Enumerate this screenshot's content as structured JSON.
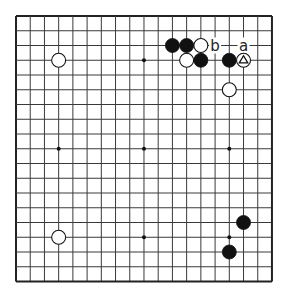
{
  "board": {
    "size": 19,
    "origin_x": 16,
    "origin_y": 16,
    "spacing_x": 14.22,
    "spacing_y": 14.75,
    "stone_radius": 7,
    "line_color": "#3a3a3a",
    "border_color": "#222222",
    "star_points": [
      [
        3,
        3
      ],
      [
        3,
        9
      ],
      [
        3,
        15
      ],
      [
        9,
        3
      ],
      [
        9,
        9
      ],
      [
        9,
        15
      ],
      [
        15,
        3
      ],
      [
        15,
        9
      ],
      [
        15,
        15
      ]
    ]
  },
  "stones": [
    {
      "color": "white",
      "col": 3,
      "row": 3
    },
    {
      "color": "black",
      "col": 11,
      "row": 2
    },
    {
      "color": "black",
      "col": 12,
      "row": 2
    },
    {
      "color": "white",
      "col": 13,
      "row": 2
    },
    {
      "color": "white",
      "col": 12,
      "row": 3
    },
    {
      "color": "black",
      "col": 13,
      "row": 3
    },
    {
      "color": "black",
      "col": 15,
      "row": 3
    },
    {
      "color": "white",
      "col": 16,
      "row": 3,
      "marker": "triangle"
    },
    {
      "color": "white",
      "col": 15,
      "row": 5
    },
    {
      "color": "black",
      "col": 16,
      "row": 14
    },
    {
      "color": "black",
      "col": 15,
      "row": 16
    },
    {
      "color": "white",
      "col": 3,
      "row": 15
    }
  ],
  "labels": [
    {
      "text": "b",
      "col": 14,
      "row": 2
    },
    {
      "text": "a",
      "col": 16,
      "row": 2
    }
  ]
}
